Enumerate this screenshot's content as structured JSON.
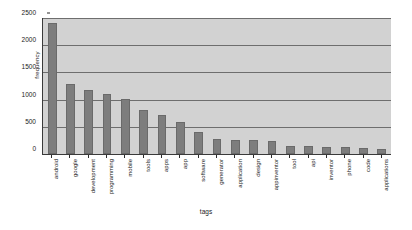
{
  "chart_data": {
    "type": "bar",
    "title": "",
    "xlabel": "tags",
    "ylabel": "frequency",
    "ylim": [
      0,
      2500
    ],
    "ytick_labels": [
      "0",
      "500",
      "1000",
      "1500",
      "2000",
      "2500"
    ],
    "ytick_values": [
      0,
      500,
      1000,
      1500,
      2000,
      2500
    ],
    "grid": true,
    "legend": "none",
    "categories": [
      "android",
      "google",
      "development",
      "programming",
      "mobile",
      "tools",
      "apps",
      "app",
      "software",
      "generator",
      "application",
      "design",
      "appinventor",
      "tool",
      "api",
      "inventor",
      "phone",
      "code",
      "applications"
    ],
    "values": [
      2400,
      1280,
      1170,
      1100,
      1020,
      800,
      720,
      590,
      400,
      280,
      260,
      250,
      240,
      150,
      140,
      130,
      125,
      110,
      100
    ],
    "bar_color": "#7d7d7d",
    "plot_background": "#d2d2d2",
    "gridline_color": "#6e6e6e",
    "axis_color": "#3a3a3a"
  }
}
